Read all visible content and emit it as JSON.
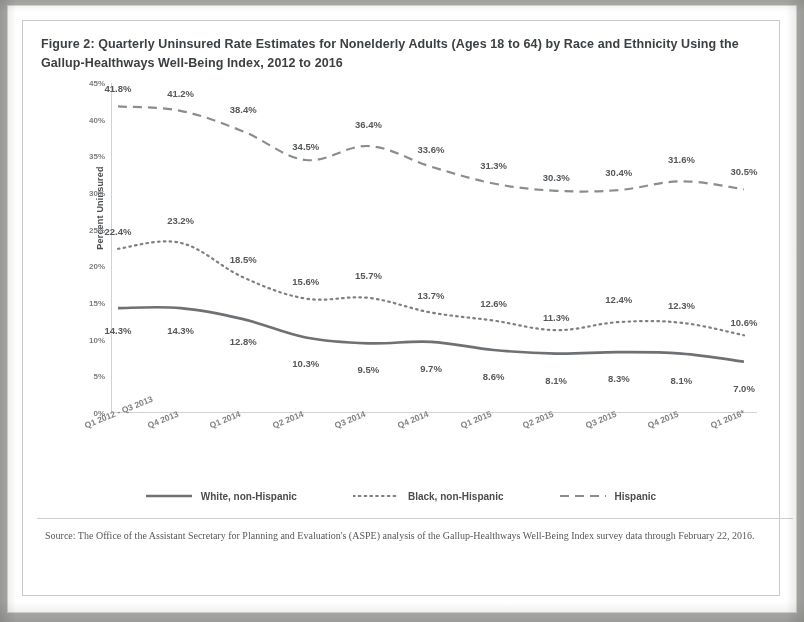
{
  "figure": {
    "title": "Figure 2: Quarterly Uninsured Rate Estimates for Nonelderly Adults (Ages 18 to 64) by Race and Ethnicity Using the Gallup-Healthways Well-Being Index, 2012 to 2016",
    "source": "Source: The Office of the Assistant Secretary for Planning and Evaluation's (ASPE) analysis of the Gallup-Healthways Well-Being Index survey data through February 22, 2016."
  },
  "chart_data": {
    "type": "line",
    "title": "Figure 2: Quarterly Uninsured Rate Estimates for Nonelderly Adults (Ages 18 to 64) by Race and Ethnicity Using the Gallup-Healthways Well-Being Index, 2012 to 2016",
    "xlabel": "",
    "ylabel": "Percent Uninsured",
    "ylim": [
      0,
      45
    ],
    "yticks": [
      0,
      5,
      10,
      15,
      20,
      25,
      30,
      35,
      40,
      45
    ],
    "ytick_labels": [
      "0%",
      "5%",
      "10%",
      "15%",
      "20%",
      "25%",
      "30%",
      "35%",
      "40%",
      "45%"
    ],
    "grid": false,
    "legend_position": "bottom",
    "categories": [
      "Q1 2012 - Q3 2013",
      "Q4 2013",
      "Q1 2014",
      "Q2 2014",
      "Q3 2014",
      "Q4 2014",
      "Q1 2015",
      "Q2 2015",
      "Q3 2015",
      "Q4 2015",
      "Q1 2016*"
    ],
    "series": [
      {
        "name": "White, non-Hispanic",
        "style": "solid",
        "color": "#6e7174",
        "values": [
          14.3,
          14.3,
          12.8,
          10.3,
          9.5,
          9.7,
          8.6,
          8.1,
          8.3,
          8.1,
          7.0
        ],
        "labels": [
          "14.3%",
          "14.3%",
          "12.8%",
          "10.3%",
          "9.5%",
          "9.7%",
          "8.6%",
          "8.1%",
          "8.3%",
          "8.1%",
          "7.0%"
        ]
      },
      {
        "name": "Black, non-Hispanic",
        "style": "dotted",
        "color": "#7d8083",
        "values": [
          22.4,
          23.2,
          18.5,
          15.6,
          15.7,
          13.7,
          12.6,
          11.3,
          12.4,
          12.3,
          10.6
        ],
        "labels": [
          "22.4%",
          "23.2%",
          "18.5%",
          "15.6%",
          "15.7%",
          "13.7%",
          "12.6%",
          "11.3%",
          "12.4%",
          "12.3%",
          "10.6%"
        ]
      },
      {
        "name": "Hispanic",
        "style": "dashed",
        "color": "#8a8d90",
        "values": [
          41.8,
          41.2,
          38.4,
          34.5,
          36.4,
          33.6,
          31.3,
          30.3,
          30.4,
          31.6,
          30.5
        ],
        "labels": [
          "41.8%",
          "41.2%",
          "38.4%",
          "34.5%",
          "36.4%",
          "33.6%",
          "31.3%",
          "30.3%",
          "30.4%",
          "31.6%",
          "30.5%"
        ]
      }
    ]
  },
  "legend": {
    "items": [
      {
        "label": "White, non-Hispanic",
        "style": "solid"
      },
      {
        "label": "Black, non-Hispanic",
        "style": "dotted"
      },
      {
        "label": "Hispanic",
        "style": "dashed"
      }
    ]
  }
}
